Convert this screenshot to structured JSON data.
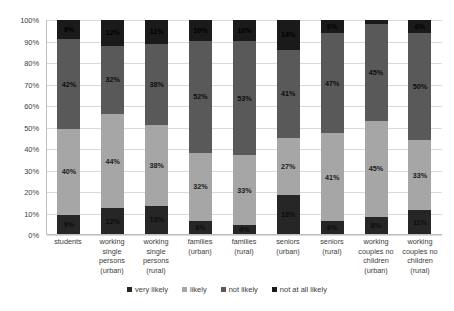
{
  "chart_data": {
    "type": "bar",
    "stacked": true,
    "orientation": "vertical",
    "title": "",
    "subtitle": "",
    "xlabel": "",
    "ylabel": "",
    "ylim": [
      0,
      100
    ],
    "grid": true,
    "legend_position": "bottom",
    "y_ticks": [
      "0%",
      "10%",
      "20%",
      "30%",
      "40%",
      "50%",
      "60%",
      "70%",
      "80%",
      "90%",
      "100%"
    ],
    "y_tick_values": [
      0,
      10,
      20,
      30,
      40,
      50,
      60,
      70,
      80,
      90,
      100
    ],
    "categories": [
      "students",
      "working single persons (urban)",
      "working single persons (rural)",
      "families (urban)",
      "families (rural)",
      "seniors (urban)",
      "seniors (rural)",
      "working couples no children (urban)",
      "working couples no children (rural)"
    ],
    "series": [
      {
        "name": "very likely",
        "color": "#262626",
        "values": [
          9,
          12,
          13,
          6,
          4,
          18,
          6,
          8,
          11
        ],
        "labels": [
          "9%",
          "12%",
          "13%",
          "6%",
          "4%",
          "18%",
          "6%",
          "8%",
          "11%"
        ]
      },
      {
        "name": "likely",
        "color": "#a6a6a6",
        "values": [
          40,
          44,
          38,
          32,
          33,
          27,
          41,
          45,
          33
        ],
        "labels": [
          "40%",
          "44%",
          "38%",
          "32%",
          "33%",
          "27%",
          "41%",
          "45%",
          "33%"
        ]
      },
      {
        "name": "not likely",
        "color": "#595959",
        "values": [
          42,
          32,
          38,
          52,
          53,
          41,
          47,
          45,
          50
        ],
        "labels": [
          "42%",
          "32%",
          "38%",
          "52%",
          "53%",
          "41%",
          "47%",
          "45%",
          "50%"
        ]
      },
      {
        "name": "not at all likely",
        "color": "#1a1a1a",
        "values": [
          9,
          12,
          11,
          10,
          10,
          14,
          6,
          2,
          6
        ],
        "labels": [
          "9%",
          "12%",
          "11%",
          "10%",
          "10%",
          "14%",
          "6%",
          "2%",
          "6%"
        ]
      }
    ]
  }
}
